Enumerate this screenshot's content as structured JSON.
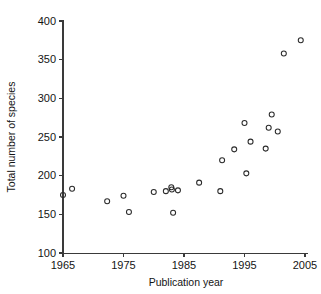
{
  "chart_data": {
    "type": "scatter",
    "title": "",
    "xlabel": "Publication year",
    "ylabel": "Total number of species",
    "xlim": [
      1964,
      2006
    ],
    "ylim": [
      100,
      400
    ],
    "xticks": [
      1965,
      1975,
      1985,
      1995,
      2005
    ],
    "yticks": [
      100,
      150,
      200,
      250,
      300,
      350,
      400
    ],
    "xtick_labels": [
      "1965",
      "1975",
      "1985",
      "1995",
      "2005"
    ],
    "ytick_labels": [
      "100",
      "150",
      "200",
      "250",
      "300",
      "350",
      "400"
    ],
    "grid": false,
    "legend": null,
    "marker": "open-circle",
    "marker_color": "#2b2b2b",
    "points": [
      {
        "x": 1965.0,
        "y": 175
      },
      {
        "x": 1966.5,
        "y": 183
      },
      {
        "x": 1972.3,
        "y": 167
      },
      {
        "x": 1975.0,
        "y": 174
      },
      {
        "x": 1975.9,
        "y": 153
      },
      {
        "x": 1980.0,
        "y": 179
      },
      {
        "x": 1982.0,
        "y": 180
      },
      {
        "x": 1982.9,
        "y": 185
      },
      {
        "x": 1983.0,
        "y": 182
      },
      {
        "x": 1983.2,
        "y": 152
      },
      {
        "x": 1984.0,
        "y": 181
      },
      {
        "x": 1987.5,
        "y": 191
      },
      {
        "x": 1991.0,
        "y": 180
      },
      {
        "x": 1991.3,
        "y": 220
      },
      {
        "x": 1993.3,
        "y": 234
      },
      {
        "x": 1995.0,
        "y": 268
      },
      {
        "x": 1995.3,
        "y": 203
      },
      {
        "x": 1996.0,
        "y": 244
      },
      {
        "x": 1998.5,
        "y": 235
      },
      {
        "x": 1999.0,
        "y": 262
      },
      {
        "x": 1999.5,
        "y": 279
      },
      {
        "x": 2000.5,
        "y": 257
      },
      {
        "x": 2001.5,
        "y": 358
      },
      {
        "x": 2004.3,
        "y": 375
      }
    ]
  },
  "axes": {
    "x_axis_name": "publication-year-axis",
    "y_axis_name": "total-species-axis"
  }
}
